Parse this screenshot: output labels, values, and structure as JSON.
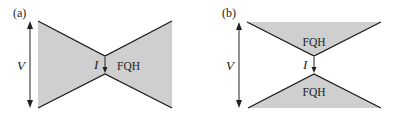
{
  "colors": {
    "fill": "#cfcfcf",
    "stroke": "#1a1a1a",
    "arrow": "#222222"
  },
  "panels": [
    {
      "label": "(a)",
      "voltage_label": "V",
      "current_label": "I",
      "regions": [
        "FQH"
      ],
      "description": "bow-tie shaped FQH region with narrow constriction; current I flows across the constriction"
    },
    {
      "label": "(b)",
      "voltage_label": "V",
      "current_label": "I",
      "regions": [
        "FQH",
        "FQH"
      ],
      "description": "two separate triangular FQH regions (top and bottom) with current I tunneling between apexes"
    }
  ]
}
